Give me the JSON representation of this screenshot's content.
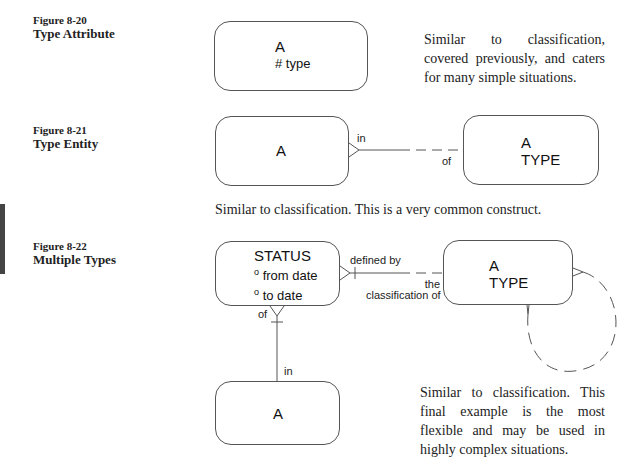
{
  "figures": [
    {
      "number": "Figure 8-20",
      "title": "Type Attribute",
      "entities": [
        {
          "name": "A",
          "attributes": [
            "# type"
          ]
        }
      ],
      "description": "Similar to classification, covered previously, and caters for many simple situations."
    },
    {
      "number": "Figure 8-21",
      "title": "Type Entity",
      "entities": [
        {
          "name": "A"
        },
        {
          "name_line1": "A",
          "name_line2": "TYPE"
        }
      ],
      "relationship": {
        "label_a": "in",
        "label_b": "of"
      },
      "description": "Similar to classification. This is a very common construct."
    },
    {
      "number": "Figure 8-22",
      "title": "Multiple Types",
      "entities": [
        {
          "name": "STATUS",
          "attributes": [
            "from date",
            "to date"
          ],
          "attr_marker": "o"
        },
        {
          "name_line1": "A",
          "name_line2": "TYPE"
        },
        {
          "name": "A"
        }
      ],
      "relationships": {
        "status_type": {
          "label_a": "defined by",
          "label_b_line1": "the",
          "label_b_line2": "classification of"
        },
        "status_a": {
          "label_a": "of",
          "label_b": "in"
        }
      },
      "description": "Similar to classification. This final example is the most flexible and may be used in highly complex situations."
    }
  ]
}
